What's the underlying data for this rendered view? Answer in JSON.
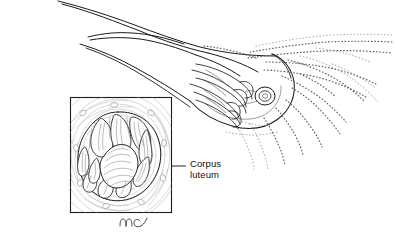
{
  "figure": {
    "background_color": "#ffffff",
    "ink_color": "#1b1b1b",
    "stipple_color": "#5d5d5d",
    "stroma_color": "#b9b9b9",
    "width": 396,
    "height": 245
  },
  "labels": {
    "corpus_luteum": {
      "line1": "Corpus",
      "line2": "luteum",
      "x": 190,
      "y": 159
    }
  },
  "leader": {
    "name": "corpus-luteum-leader-line",
    "x1": 140,
    "y1": 166,
    "x2": 186,
    "y2": 166
  },
  "inset": {
    "name": "corpus-luteum-inset-box",
    "x": 70,
    "y": 97,
    "width": 102,
    "height": 116,
    "description": "Magnified cross-section of ovary showing corpus luteum"
  },
  "signature": {
    "text": "mc",
    "x": 122,
    "y": 224
  },
  "anatomy": {
    "parts": [
      {
        "name": "fallopian-tube",
        "description": "Uterine tube sweeping from upper left"
      },
      {
        "name": "fimbriae",
        "description": "Finger-like stippled fringes at tube end"
      },
      {
        "name": "ovary",
        "description": "Ovary with small corpus luteum visible"
      },
      {
        "name": "corpus-luteum-surface",
        "description": "Small circular corpus luteum on ovary surface"
      }
    ]
  }
}
